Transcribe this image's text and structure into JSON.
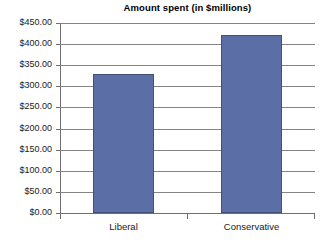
{
  "chart_data": {
    "type": "bar",
    "title": "Amount spent (in $millions)",
    "xlabel": "",
    "ylabel": "",
    "categories": [
      "Liberal",
      "Conservative"
    ],
    "values": [
      329.0,
      422.0
    ],
    "ylim": [
      0,
      450
    ],
    "ytick_values": [
      0,
      50,
      100,
      150,
      200,
      250,
      300,
      350,
      400,
      450
    ],
    "ytick_labels": [
      "$0.00",
      "$50.00",
      "$100.00",
      "$150.00",
      "$200.00",
      "$250.00",
      "$300.00",
      "$350.00",
      "$400.00",
      "$450.00"
    ],
    "grid": true,
    "legend": false,
    "legend_position": "none",
    "series": [
      {
        "name": "Amount spent",
        "values": [
          329.0,
          422.0
        ],
        "color": "#5B6FA6"
      }
    ],
    "colors": {
      "bar_fill": "#5B6FA6",
      "bar_border": "#41517D",
      "gridline": "#848484",
      "axis": "#6E6E6E",
      "text": "#1A1A1A",
      "background": "#FFFFFF"
    }
  }
}
